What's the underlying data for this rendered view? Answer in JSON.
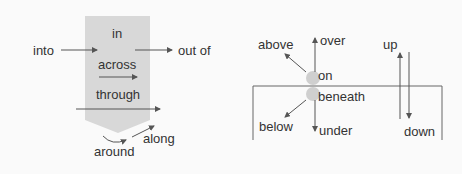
{
  "colors": {
    "shade": "#d8d8d8",
    "line": "#555555",
    "text": "#333333",
    "dot": "#cfcfcf"
  },
  "left_diagram": {
    "labels": {
      "into": "into",
      "in": "in",
      "out_of": "out of",
      "across": "across",
      "through": "through",
      "along": "along",
      "around": "around"
    }
  },
  "right_diagram": {
    "labels": {
      "above": "above",
      "over": "over",
      "on": "on",
      "beneath": "beneath",
      "below": "below",
      "under": "under",
      "up": "up",
      "down": "down"
    }
  }
}
